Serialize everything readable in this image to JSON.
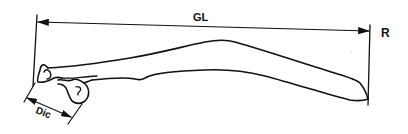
{
  "diagram": {
    "labels": {
      "greatest_length": "GL",
      "side": "R",
      "diagonal": "Dic"
    },
    "colors": {
      "ink": "#111111",
      "background": "#ffffff"
    }
  }
}
